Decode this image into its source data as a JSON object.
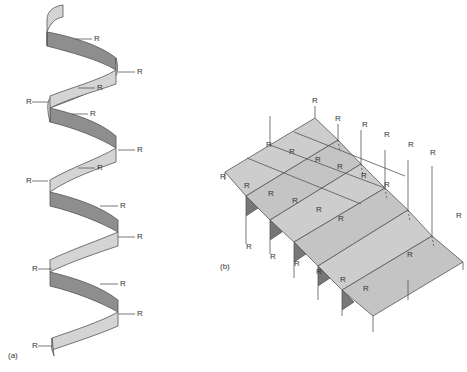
{
  "figure": {
    "panel_a": {
      "label": "(a)",
      "description": "alpha helix ribbon with side chains",
      "side_chain_label": "R",
      "colors": {
        "front": "#d4d4d4",
        "back": "#8e8e8e",
        "edge": "#555555"
      }
    },
    "panel_b": {
      "label": "(b)",
      "description": "pleated beta sheet with side chains",
      "side_chain_label": "R",
      "colors": {
        "face": "#c9c9c9",
        "fold": "#777777",
        "edge": "#555555"
      }
    }
  }
}
